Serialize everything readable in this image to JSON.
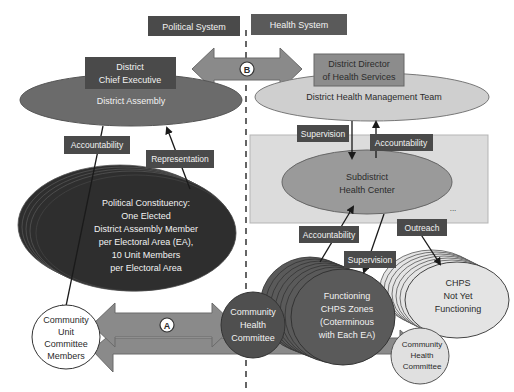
{
  "headers": {
    "political": "Political System",
    "health": "Health System"
  },
  "political": {
    "chief_executive": [
      "District",
      "Chief Executive"
    ],
    "assembly": "District Assembly",
    "accountability_label": "Accountability",
    "representation_label": "Representation",
    "constituency": [
      "Political Constituency:",
      "One Elected",
      "District Assembly Member",
      "per Electoral Area (EA),",
      "10 Unit Members",
      "per Electoral Area"
    ],
    "unit_committee": [
      "Community",
      "Unit",
      "Committee",
      "Members"
    ]
  },
  "health": {
    "director": [
      "District Director",
      "of Health Services"
    ],
    "dhmt": "District Health Management Team",
    "supervision_label": "Supervision",
    "accountability_label": "Accountability",
    "subdistrict": [
      "Subdistrict",
      "Health Center"
    ],
    "ellipsis": "...",
    "accountability_label_2": "Accountability",
    "supervision_label_2": "Supervision",
    "outreach_label": "Outreach",
    "functioning_chps": [
      "Functioning",
      "CHPS Zones",
      "(Coterminous",
      "with Each EA)"
    ],
    "chps_not_yet": [
      "CHPS",
      "Not Yet",
      "Functioning"
    ],
    "community_health_committee": [
      "Community",
      "Health",
      "Committee"
    ],
    "community_health_committee_2": [
      "Community",
      "Health",
      "Committee"
    ]
  },
  "markers": {
    "a": "A",
    "b": "B"
  },
  "colors": {
    "dark_box": "#4a4a4a",
    "assembly_ellipse": "#6b6b6b",
    "constituency_ellipse": "#2e2e2e",
    "dhmt_ellipse": "#cfcfcf",
    "director_box": "#8c8c8c",
    "subdistrict_ellipse": "#9a9a9a",
    "shaded_band": "#dcdcdc",
    "arrow_fill": "#8a8a8a",
    "chps_functioning": "#5a5a5a",
    "chps_not_yet": "#e4e4e4"
  }
}
